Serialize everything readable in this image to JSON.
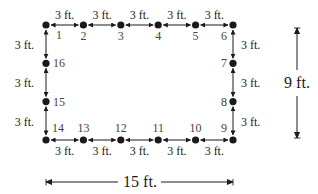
{
  "colors": {
    "ink": "#1a1a1a",
    "label": "#444444"
  },
  "posts": [
    {
      "id": "1"
    },
    {
      "id": "2"
    },
    {
      "id": "3"
    },
    {
      "id": "4"
    },
    {
      "id": "5"
    },
    {
      "id": "6"
    },
    {
      "id": "7"
    },
    {
      "id": "8"
    },
    {
      "id": "9"
    },
    {
      "id": "10"
    },
    {
      "id": "11"
    },
    {
      "id": "12"
    },
    {
      "id": "13"
    },
    {
      "id": "14"
    },
    {
      "id": "15"
    },
    {
      "id": "16"
    }
  ],
  "segment_label": "3 ft.",
  "overall": {
    "width_label": "15 ft.",
    "height_label": "9 ft."
  }
}
